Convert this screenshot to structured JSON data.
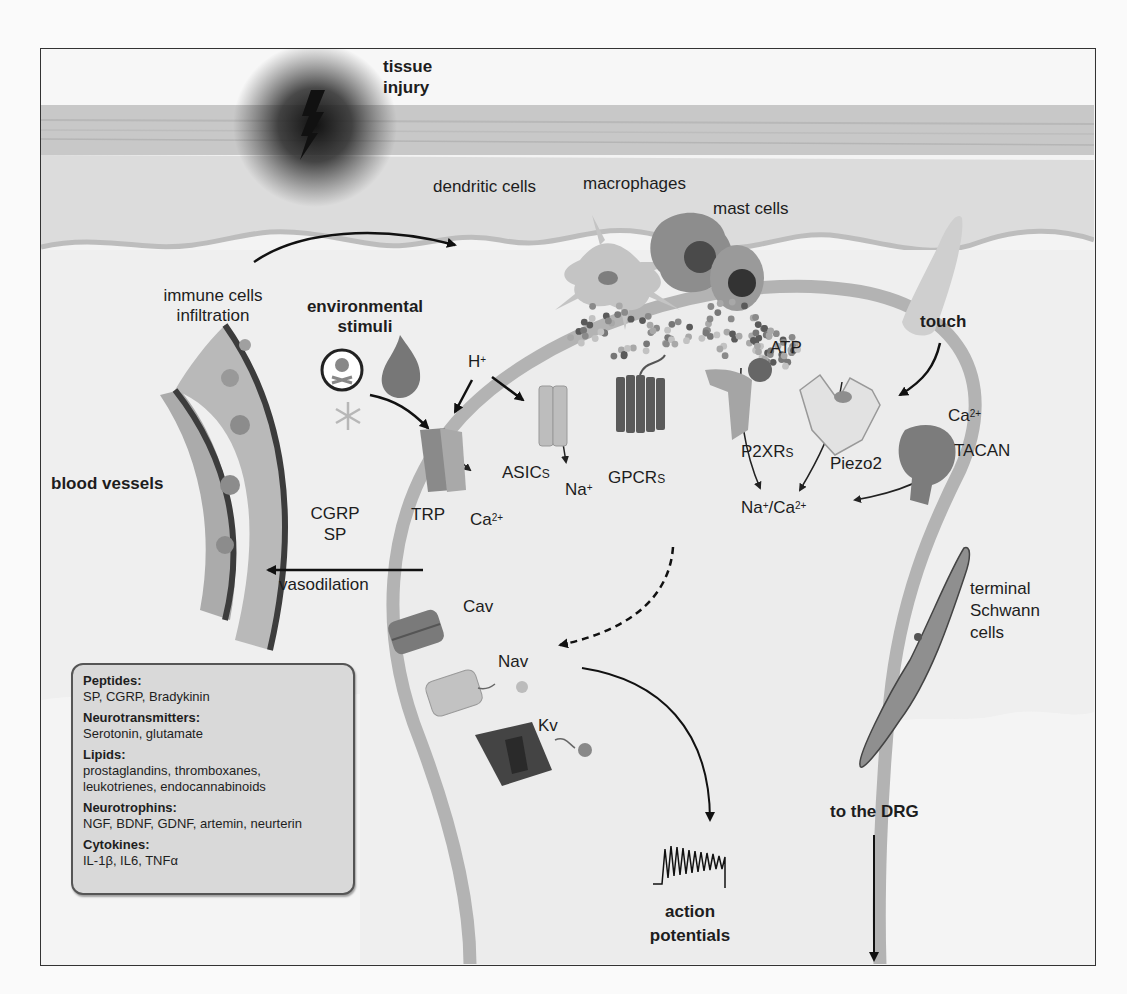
{
  "figure": {
    "type": "pain-nociceptor-terminal-diagram",
    "colors": {
      "frame_border": "#333333",
      "skin_band": "#c9c9c9",
      "dermis": "#dedede",
      "membrane": "#b5b5b5",
      "legend_bg": "#d9d9d9",
      "injury_glow": "#1a1a1a"
    }
  },
  "labels": {
    "tissue_injury": [
      "tissue",
      "injury"
    ],
    "dendritic_cells": "dendritic cells",
    "macrophages": "macrophages",
    "mast_cells": "mast cells",
    "immune_infiltration": [
      "immune cells",
      "infiltration"
    ],
    "environmental_stimuli": [
      "environmental",
      "stimuli"
    ],
    "touch": "touch",
    "h_plus": {
      "base": "H",
      "sup": "+"
    },
    "atp": "ATP",
    "blood_vessels": "blood vessels",
    "trp": "TRP",
    "trp_ion": {
      "base": "Ca",
      "sup": "2+"
    },
    "asics": {
      "base": "ASIC",
      "sub": "S"
    },
    "asics_ion": {
      "base": "Na",
      "sup": "+"
    },
    "gpcrs": {
      "base": "GPCR",
      "sub": "S"
    },
    "p2xrs": {
      "base": "P2XR",
      "sub": "S"
    },
    "piezo2": "Piezo2",
    "tacan_ion": {
      "base": "Ca",
      "sup": "2+"
    },
    "tacan": "TACAN",
    "mixed_ion": {
      "part1": "Na",
      "sup1": "+",
      "part2": "/Ca",
      "sup2": "2+"
    },
    "cgrp": "CGRP",
    "sp": "SP",
    "vasodilation": "vasodilation",
    "cav": "Cav",
    "nav": "Nav",
    "kv": "Kv",
    "terminal_schwann": [
      "terminal",
      "Schwann",
      "cells"
    ],
    "to_drg": "to the DRG",
    "action_potentials": [
      "action",
      "potentials"
    ]
  },
  "legend": {
    "groups": [
      {
        "heading": "Peptides:",
        "items": "SP, CGRP, Bradykinin"
      },
      {
        "heading": "Neurotransmitters:",
        "items": "Serotonin, glutamate"
      },
      {
        "heading": "Lipids:",
        "items": "prostaglandins, thromboxanes,",
        "items2": "leukotrienes, endocannabinoids"
      },
      {
        "heading": "Neurotrophins:",
        "items": "NGF, BDNF, GDNF, artemin, neurterin"
      },
      {
        "heading": "Cytokines:",
        "items": "IL-1β, IL6, TNFα"
      }
    ]
  },
  "icons": [
    "lightning-bolt-icon",
    "skull-crossbones-icon",
    "flame-icon",
    "snowflake-icon",
    "finger-icon"
  ]
}
